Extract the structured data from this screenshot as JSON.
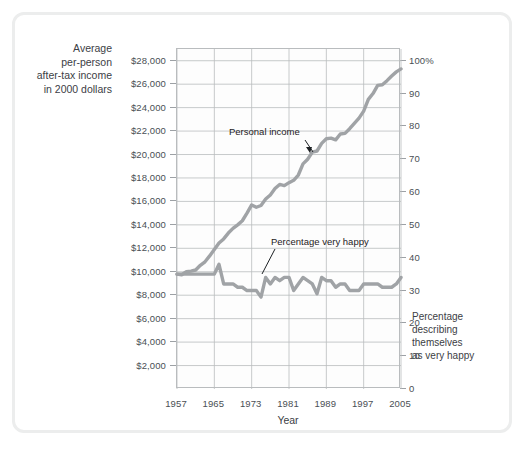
{
  "axes": {
    "left_title": [
      "Average",
      "per-person",
      "after-tax income",
      "in 2000 dollars"
    ],
    "right_title": [
      "Percentage",
      "describing",
      "themselves",
      "as very happy"
    ],
    "x_title": "Year"
  },
  "annotations": [
    {
      "name": "personal-income",
      "text": "Personal income"
    },
    {
      "name": "percentage-very-happy",
      "text": "Percentage very happy"
    }
  ],
  "colors": {
    "series_line": "#a0a3a6",
    "gridline": "#b9bcbe",
    "axis_text": "#4a4f54",
    "frame": "#eceded",
    "plot_background": "#fdfdfd"
  },
  "chart_data": {
    "type": "line",
    "title": "",
    "subtitle": "",
    "xlabel": "Year",
    "grid": true,
    "legend_position": "inline-annotations",
    "x": [
      1957,
      1958,
      1959,
      1960,
      1961,
      1962,
      1963,
      1964,
      1965,
      1966,
      1967,
      1968,
      1969,
      1970,
      1971,
      1972,
      1973,
      1974,
      1975,
      1976,
      1977,
      1978,
      1979,
      1980,
      1981,
      1982,
      1983,
      1984,
      1985,
      1986,
      1987,
      1988,
      1989,
      1990,
      1991,
      1992,
      1993,
      1994,
      1995,
      1996,
      1997,
      1998,
      1999,
      2000,
      2001,
      2002,
      2003,
      2004,
      2005
    ],
    "x_ticks": [
      1957,
      1965,
      1973,
      1981,
      1989,
      1997,
      2005
    ],
    "xlim": [
      1957,
      2005
    ],
    "axis_left": {
      "label_lines": [
        "Average",
        "per-person",
        "after-tax income",
        "in 2000 dollars"
      ],
      "ticks": [
        "$2,000",
        "$4,000",
        "$6,000",
        "$8,000",
        "$10,000",
        "$12,000",
        "$14,000",
        "$16,000",
        "$18,000",
        "$20,000",
        "$22,000",
        "$24,000",
        "$26,000",
        "$28,000"
      ],
      "tick_values": [
        2000,
        4000,
        6000,
        8000,
        10000,
        12000,
        14000,
        16000,
        18000,
        20000,
        22000,
        24000,
        26000,
        28000
      ],
      "limits": [
        0,
        29000
      ]
    },
    "axis_right": {
      "label_lines": [
        "Percentage",
        "describing",
        "themselves",
        "as very happy"
      ],
      "ticks": [
        "0",
        "10",
        "20",
        "30",
        "40",
        "50",
        "60",
        "70",
        "80",
        "90",
        "100%"
      ],
      "tick_values": [
        0,
        10,
        20,
        30,
        40,
        50,
        60,
        70,
        80,
        90,
        100
      ],
      "limits": [
        0,
        103.6
      ]
    },
    "series": [
      {
        "name": "Personal income",
        "axis": "left",
        "units": "2000 dollars",
        "values": [
          9800,
          9750,
          10000,
          10050,
          10150,
          10550,
          10850,
          11350,
          11900,
          12450,
          12800,
          13300,
          13700,
          14000,
          14350,
          15000,
          15700,
          15500,
          15650,
          16200,
          16550,
          17100,
          17450,
          17350,
          17600,
          17800,
          18250,
          19200,
          19600,
          20200,
          20300,
          20950,
          21350,
          21400,
          21250,
          21750,
          21800,
          22200,
          22650,
          23100,
          23700,
          24700,
          25200,
          25900,
          25950,
          26300,
          26700,
          27050,
          27300
        ]
      },
      {
        "name": "Percentage very happy",
        "axis": "right",
        "units": "percent",
        "values": [
          35,
          35,
          35,
          35,
          35,
          35,
          35,
          35,
          35,
          38,
          32,
          32,
          32,
          31,
          31,
          30,
          30,
          30,
          28,
          34,
          32,
          34,
          33,
          34,
          34,
          30,
          32,
          34,
          33,
          32,
          29,
          34,
          33,
          33,
          31,
          32,
          32,
          30,
          30,
          30,
          32,
          32,
          32,
          32,
          31,
          31,
          31,
          32,
          34
        ]
      }
    ]
  }
}
